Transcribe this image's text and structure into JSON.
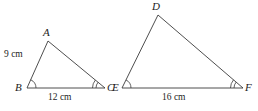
{
  "figure": {
    "background_color": "#ffffff",
    "stroke_color": "#3a3a3a",
    "text_color": "#1c1c1c",
    "stroke_width": 0.9
  },
  "triangles": [
    {
      "name": "triangle-abc",
      "vertices": [
        {
          "label": "A",
          "x": 48,
          "y": 41,
          "label_x": 43,
          "label_y": 27
        },
        {
          "label": "B",
          "x": 27,
          "y": 88,
          "label_x": 15,
          "label_y": 82
        },
        {
          "label": "C",
          "x": 105,
          "y": 88,
          "label_x": 107,
          "label_y": 82
        }
      ],
      "angle_marks": [
        {
          "at": "B",
          "arcs": 1
        },
        {
          "at": "C",
          "arcs": 2
        }
      ],
      "side_labels": [
        {
          "text": "9 cm",
          "x": 4,
          "y": 50
        },
        {
          "text": "12 cm",
          "x": 48,
          "y": 93
        }
      ]
    },
    {
      "name": "triangle-def",
      "vertices": [
        {
          "label": "D",
          "x": 158,
          "y": 15,
          "label_x": 152,
          "label_y": 1
        },
        {
          "label": "E",
          "x": 122,
          "y": 88,
          "label_x": 112,
          "label_y": 82
        },
        {
          "label": "F",
          "x": 243,
          "y": 88,
          "label_x": 245,
          "label_y": 82
        }
      ],
      "angle_marks": [
        {
          "at": "E",
          "arcs": 1
        },
        {
          "at": "F",
          "arcs": 2
        }
      ],
      "side_labels": [
        {
          "text": "16 cm",
          "x": 162,
          "y": 93
        }
      ]
    }
  ]
}
